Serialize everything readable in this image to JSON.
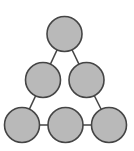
{
  "diagram": {
    "type": "graph",
    "colors": {
      "background": "#ffffff",
      "node_fill": "#b9b9b9",
      "node_stroke": "#454545",
      "edge": "#454545"
    },
    "node_radius": 17.5,
    "nodes": [
      {
        "id": "n1",
        "x": 64.5,
        "y": 34
      },
      {
        "id": "n2",
        "x": 43,
        "y": 80
      },
      {
        "id": "n3",
        "x": 86.5,
        "y": 80
      },
      {
        "id": "n4",
        "x": 22,
        "y": 125
      },
      {
        "id": "n5",
        "x": 65.5,
        "y": 125
      },
      {
        "id": "n6",
        "x": 109,
        "y": 125
      }
    ],
    "edges": [
      {
        "from": "n1",
        "to": "n2"
      },
      {
        "from": "n1",
        "to": "n3"
      },
      {
        "from": "n2",
        "to": "n4"
      },
      {
        "from": "n3",
        "to": "n6"
      },
      {
        "from": "n4",
        "to": "n5"
      },
      {
        "from": "n5",
        "to": "n6"
      }
    ]
  }
}
